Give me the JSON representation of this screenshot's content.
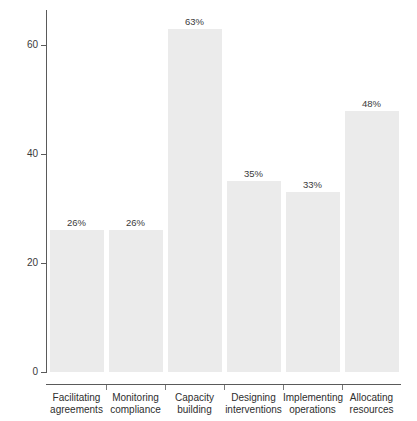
{
  "chart_data": {
    "type": "bar",
    "title": "",
    "xlabel": "",
    "ylabel": "Percentage of institutions",
    "ylim": [
      0,
      66
    ],
    "grid": false,
    "legend": null,
    "y_ticks": [
      0,
      20,
      40,
      60
    ],
    "y_tick_labels": [
      "0",
      "20",
      "40",
      "60"
    ],
    "categories": [
      "Facilitating agreements",
      "Monitoring compliance",
      "Capacity building",
      "Designing interventions",
      "Implementing operations",
      "Allocating resources"
    ],
    "category_lines": [
      [
        "Facilitating",
        "agreements"
      ],
      [
        "Monitoring",
        "compliance"
      ],
      [
        "Capacity",
        "building"
      ],
      [
        "Designing",
        "interventions"
      ],
      [
        "Implementing",
        "operations"
      ],
      [
        "Allocating",
        "resources"
      ]
    ],
    "values": [
      26,
      26,
      63,
      35,
      33,
      48
    ],
    "data_labels": [
      "26%",
      "26%",
      "63%",
      "35%",
      "33%",
      "48%"
    ],
    "bar_color": "#ebebeb",
    "axis_color": "#5a5a5a",
    "text_color": "#2e2e2e",
    "background": "#ffffff"
  }
}
